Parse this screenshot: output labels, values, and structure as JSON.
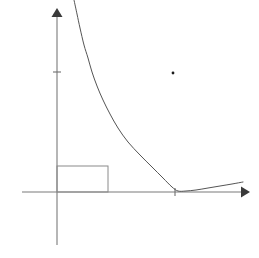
{
  "figure": {
    "background_color": "#ffffff",
    "width": 259,
    "height": 258
  },
  "colors": {
    "axis": "#7a7a7a",
    "arrow": "#3a3a3a",
    "curve": "#555555",
    "rectangle": "#8a8a8a",
    "tick": "#6f6f6f",
    "dot": "#1a1a1a"
  },
  "chart_data": {
    "type": "line",
    "title": "",
    "subtitle": "",
    "xlabel": "",
    "ylabel": "",
    "grid": false,
    "legend": null,
    "legend_position": "none",
    "origin_px": [
      57,
      192
    ],
    "xlim_px": [
      22,
      245
    ],
    "ylim_px": [
      245,
      12
    ],
    "axes": {
      "x_axis": {
        "start_px": [
          22,
          192
        ],
        "end_px": [
          245,
          192
        ],
        "arrow": "right",
        "ticks_px": [
          175
        ],
        "tick_labels": []
      },
      "y_axis": {
        "start_px": [
          57,
          245
        ],
        "end_px": [
          57,
          12
        ],
        "arrow": "up",
        "ticks_px": [
          72
        ],
        "tick_labels": []
      }
    },
    "series": [
      {
        "name": "decay-curve",
        "description": "smooth decreasing curve approaching and grazing the x-axis then rising slightly",
        "points_px": [
          [
            74,
            0
          ],
          [
            77,
            14
          ],
          [
            80,
            28
          ],
          [
            84,
            45
          ],
          [
            88,
            58
          ],
          [
            92,
            72
          ],
          [
            97,
            86
          ],
          [
            103,
            100
          ],
          [
            110,
            114
          ],
          [
            118,
            128
          ],
          [
            128,
            142
          ],
          [
            140,
            155
          ],
          [
            152,
            167
          ],
          [
            163,
            178
          ],
          [
            172,
            187
          ],
          [
            178,
            191
          ],
          [
            186,
            191
          ],
          [
            196,
            190
          ],
          [
            208,
            188
          ],
          [
            220,
            186
          ],
          [
            232,
            184
          ],
          [
            243,
            182
          ]
        ]
      }
    ],
    "annotations": [
      {
        "name": "inscribed-rectangle",
        "type": "rect",
        "x_px": 57,
        "y_px": 166,
        "width_px": 51,
        "height_px": 26
      },
      {
        "name": "isolated-point",
        "type": "dot",
        "cx_px": 173,
        "cy_px": 73,
        "r_px": 1.3
      },
      {
        "name": "y-axis-tick",
        "type": "tick",
        "x_px": 57,
        "y_px": 72,
        "half_len_px": 4
      },
      {
        "name": "x-axis-tick",
        "type": "tick",
        "x_px": 175,
        "y_px": 192,
        "half_len_px": 4
      }
    ]
  }
}
